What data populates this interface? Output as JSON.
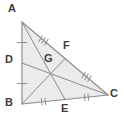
{
  "figure": {
    "kind": "geometry-diagram",
    "shape": "triangle",
    "width": 124,
    "height": 123,
    "background_color": "#ffffff",
    "fill_color": "#ebebeb",
    "stroke_color": "#8c8c8c",
    "label_color": "#3c3c3c",
    "tick_color": "#8c8c8c",
    "stroke_width": 1
  },
  "points": [
    {
      "name": "A",
      "role": "vertex",
      "x": 22,
      "y": 22,
      "label": "A",
      "label_x": 8,
      "label_y": 3
    },
    {
      "name": "B",
      "role": "vertex",
      "x": 22,
      "y": 104,
      "label": "B",
      "label_x": 5,
      "label_y": 97
    },
    {
      "name": "C",
      "role": "vertex",
      "x": 108,
      "y": 95,
      "label": "C",
      "label_x": 110,
      "label_y": 88
    },
    {
      "name": "D",
      "role": "midpoint",
      "x": 22,
      "y": 63,
      "label": "D",
      "label_x": 5,
      "label_y": 54
    },
    {
      "name": "E",
      "role": "midpoint",
      "x": 65,
      "y": 99.5,
      "label": "E",
      "label_x": 61,
      "label_y": 103
    },
    {
      "name": "F",
      "role": "midpoint",
      "x": 65,
      "y": 58.5,
      "label": "F",
      "label_x": 63,
      "label_y": 40
    },
    {
      "name": "G",
      "role": "centroid",
      "x": 48,
      "y": 70,
      "label": "G",
      "label_x": 44,
      "label_y": 53
    }
  ],
  "sides": [
    {
      "name": "AB",
      "from": "A",
      "to": "B"
    },
    {
      "name": "BC",
      "from": "B",
      "to": "C"
    },
    {
      "name": "CA",
      "from": "C",
      "to": "A"
    }
  ],
  "medians": [
    {
      "name": "AE",
      "from": "A",
      "to": "E"
    },
    {
      "name": "BF",
      "from": "B",
      "to": "F"
    },
    {
      "name": "CD",
      "from": "C",
      "to": "D"
    }
  ],
  "tick_marks": [
    {
      "segment": "AD",
      "count": 1,
      "x": 22,
      "y": 42.5,
      "angle": 0
    },
    {
      "segment": "DB",
      "count": 1,
      "x": 22,
      "y": 83.5,
      "angle": 0
    },
    {
      "segment": "BE",
      "count": 2,
      "x": 43.5,
      "y": 101.8,
      "angle": -6
    },
    {
      "segment": "EC",
      "count": 2,
      "x": 86.5,
      "y": 97.3,
      "angle": -6
    },
    {
      "segment": "AF",
      "count": 3,
      "x": 43.5,
      "y": 40.3,
      "angle": 31
    },
    {
      "segment": "FC",
      "count": 3,
      "x": 86.5,
      "y": 76.8,
      "angle": 31
    }
  ],
  "labels": {
    "A": "A",
    "B": "B",
    "C": "C",
    "D": "D",
    "E": "E",
    "F": "F",
    "G": "G"
  }
}
